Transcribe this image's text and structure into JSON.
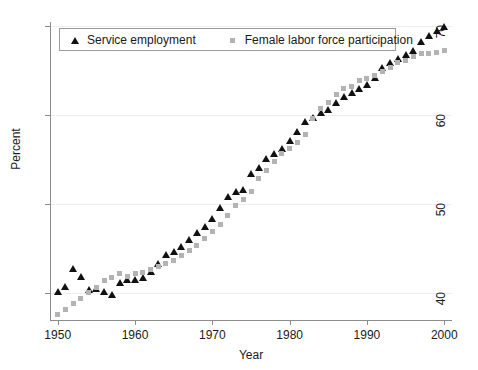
{
  "chart_data": {
    "type": "scatter",
    "title": "",
    "xlabel": "Year",
    "ylabel": "Percent",
    "xlim": [
      1949,
      2001
    ],
    "ylim": [
      37,
      70.5
    ],
    "xticks": [
      1950,
      1960,
      1970,
      1980,
      1990,
      2000
    ],
    "yticks": [
      40,
      50,
      60,
      70
    ],
    "grid": "horizontal",
    "legend_position": "top-left-inside",
    "x": [
      1950,
      1951,
      1952,
      1953,
      1954,
      1955,
      1956,
      1957,
      1958,
      1959,
      1960,
      1961,
      1962,
      1963,
      1964,
      1965,
      1966,
      1967,
      1968,
      1969,
      1970,
      1971,
      1972,
      1973,
      1974,
      1975,
      1976,
      1977,
      1978,
      1979,
      1980,
      1981,
      1982,
      1983,
      1984,
      1985,
      1986,
      1987,
      1988,
      1989,
      1990,
      1991,
      1992,
      1993,
      1994,
      1995,
      1996,
      1997,
      1998,
      1999,
      2000
    ],
    "series": [
      {
        "name": "Service employment",
        "marker": "triangle",
        "color": "#111111",
        "values": [
          40.2,
          40.8,
          42.8,
          41.9,
          40.4,
          40.5,
          40.2,
          39.9,
          41.2,
          41.6,
          41.5,
          41.8,
          42.5,
          43.4,
          44.4,
          44.7,
          45.3,
          46.1,
          46.8,
          47.5,
          48.4,
          49.6,
          50.9,
          51.4,
          51.7,
          53.5,
          54.1,
          55.1,
          55.7,
          56.3,
          57.2,
          58.2,
          59.3,
          59.8,
          60.3,
          60.7,
          61.5,
          62.1,
          62.6,
          63.0,
          63.5,
          64.3,
          65.4,
          66.0,
          66.4,
          66.8,
          67.3,
          68.3,
          69.0,
          69.5,
          70.0
        ]
      },
      {
        "name": "Female labor force participation",
        "marker": "square",
        "color": "#b3b3b3",
        "values": [
          37.6,
          38.2,
          38.8,
          39.4,
          40.1,
          40.6,
          41.4,
          41.8,
          42.2,
          41.9,
          42.2,
          42.3,
          42.7,
          43.0,
          43.3,
          43.7,
          44.2,
          44.8,
          45.4,
          46.2,
          46.9,
          47.7,
          48.8,
          49.9,
          50.5,
          51.5,
          52.9,
          53.8,
          54.8,
          55.7,
          56.3,
          57.0,
          57.8,
          59.6,
          60.8,
          61.4,
          62.3,
          63.0,
          63.2,
          63.9,
          64.1,
          64.5,
          64.9,
          65.4,
          65.9,
          66.2,
          66.6,
          67.0,
          67.0,
          67.1,
          67.3
        ]
      }
    ]
  },
  "axes": {
    "y_title": "Percent",
    "x_title": "Year",
    "y_tick_labels": [
      "40",
      "50",
      "60",
      "70"
    ],
    "x_tick_labels": [
      "1950",
      "1960",
      "1970",
      "1980",
      "1990",
      "2000"
    ]
  },
  "legend": {
    "entries": [
      {
        "label": "Service employment",
        "marker": "triangle"
      },
      {
        "label": "Female labor force participation",
        "marker": "square"
      }
    ]
  },
  "colors": {
    "series_1": "#111111",
    "series_2": "#b3b3b3",
    "axis": "#8c8c8c",
    "grid": "#ededed",
    "background": "#ffffff",
    "text": "#1a1a1a"
  }
}
